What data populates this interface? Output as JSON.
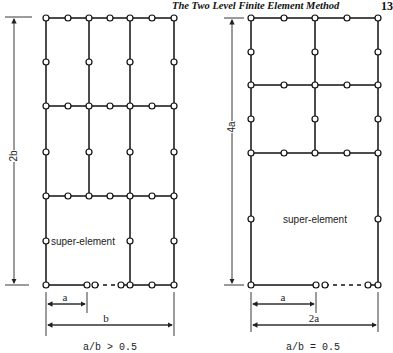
{
  "header": {
    "running_title": "The Two Level Finite Element Method",
    "page_number": "13"
  },
  "figures": [
    {
      "id": "left",
      "height_label": "2b",
      "super_element_label": "super-element",
      "dim_a_label": "a",
      "dim_width_label": "b",
      "caption": "a/b > 0.5"
    },
    {
      "id": "right",
      "height_label": "4a",
      "super_element_label": "super-element",
      "dim_a_label": "a",
      "dim_width_label": "2a",
      "caption": "a/b = 0.5"
    }
  ]
}
